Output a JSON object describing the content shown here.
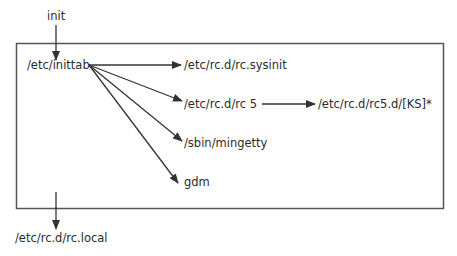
{
  "diagram": {
    "nodes": {
      "init": "init",
      "inittab": "/etc/inittab",
      "sysinit": "/etc/rc.d/rc.sysinit",
      "rc5": "/etc/rc.d/rc 5",
      "rc5d": "/etc/rc.d/rc5.d/[KS]*",
      "mingetty": "/sbin/mingetty",
      "gdm": "gdm",
      "rclocal": "/etc/rc.d/rc.local"
    },
    "edges": [
      {
        "from": "init",
        "to": "inittab"
      },
      {
        "from": "inittab",
        "to": "sysinit"
      },
      {
        "from": "inittab",
        "to": "rc5"
      },
      {
        "from": "rc5",
        "to": "rc5d"
      },
      {
        "from": "inittab",
        "to": "mingetty"
      },
      {
        "from": "inittab",
        "to": "gdm"
      },
      {
        "from": "box",
        "to": "rclocal"
      }
    ],
    "colors": {
      "line": "#333333",
      "text": "#2a2a2a",
      "background": "#ffffff"
    }
  }
}
